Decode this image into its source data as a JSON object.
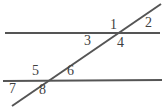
{
  "diagram": {
    "background_color": "#ffffff",
    "line_color": "#555555",
    "label_color": "#3f3f3f",
    "canvas": {
      "width": 165,
      "height": 110
    },
    "lines": [
      {
        "name": "upper-parallel-line",
        "role": "parallel",
        "x1": 5,
        "y1": 33,
        "x2": 160,
        "y2": 33,
        "stroke_width": 2
      },
      {
        "name": "lower-parallel-line",
        "role": "parallel",
        "x1": 3,
        "y1": 81,
        "x2": 162,
        "y2": 80,
        "stroke_width": 2
      },
      {
        "name": "transversal-line",
        "role": "transversal",
        "x1": 12,
        "y1": 106,
        "x2": 161,
        "y2": 4,
        "stroke_width": 2
      }
    ],
    "intersections": [
      {
        "name": "upper-intersection",
        "x": 122,
        "y": 33
      },
      {
        "name": "lower-intersection",
        "x": 45,
        "y": 81
      }
    ],
    "angle_labels": [
      {
        "id": "1",
        "text": "1",
        "x": 110,
        "y": 18,
        "position": "upper-left-of-upper-intersection"
      },
      {
        "id": "2",
        "text": "2",
        "x": 145,
        "y": 16,
        "position": "upper-right-of-upper-intersection"
      },
      {
        "id": "3",
        "text": "3",
        "x": 84,
        "y": 34,
        "position": "lower-left-of-upper-intersection"
      },
      {
        "id": "4",
        "text": "4",
        "x": 117,
        "y": 36,
        "position": "lower-right-of-upper-intersection"
      },
      {
        "id": "5",
        "text": "5",
        "x": 32,
        "y": 64,
        "position": "upper-left-of-lower-intersection"
      },
      {
        "id": "6",
        "text": "6",
        "x": 67,
        "y": 64,
        "position": "upper-right-of-lower-intersection"
      },
      {
        "id": "7",
        "text": "7",
        "x": 9,
        "y": 82,
        "position": "lower-left-of-lower-intersection"
      },
      {
        "id": "8",
        "text": "8",
        "x": 39,
        "y": 83,
        "position": "lower-right-of-lower-intersection"
      }
    ]
  }
}
